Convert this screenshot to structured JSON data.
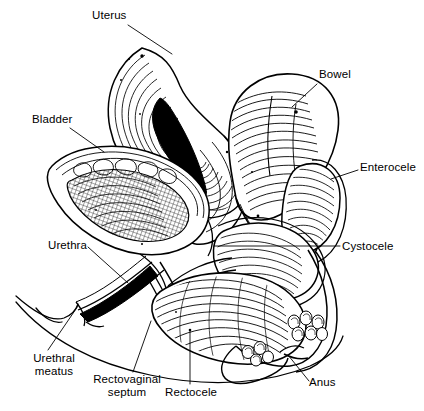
{
  "figure": {
    "type": "medical-illustration",
    "view": "sagittal-section",
    "style": "black-and-white-line-art",
    "background_color": "#ffffff",
    "ink_color": "#000000",
    "width": 424,
    "height": 411
  },
  "labels": [
    {
      "id": "uterus",
      "text": "Uterus",
      "x": 92,
      "y": 9,
      "lines": [
        "Uterus"
      ]
    },
    {
      "id": "bowel",
      "text": "Bowel",
      "x": 319,
      "y": 68,
      "lines": [
        "Bowel"
      ]
    },
    {
      "id": "bladder",
      "text": "Bladder",
      "x": 32,
      "y": 113,
      "lines": [
        "Bladder"
      ]
    },
    {
      "id": "enterocele",
      "text": "Enterocele",
      "x": 360,
      "y": 161,
      "lines": [
        "Enterocele"
      ]
    },
    {
      "id": "urethra",
      "text": "Urethra",
      "x": 48,
      "y": 239,
      "lines": [
        "Urethra"
      ]
    },
    {
      "id": "cystocele",
      "text": "Cystocele",
      "x": 342,
      "y": 240,
      "lines": [
        "Cystocele"
      ]
    },
    {
      "id": "urethral-meatus",
      "text": "Urethral meatus",
      "x": 17,
      "y": 352,
      "lines": [
        "Urethral",
        "meatus"
      ]
    },
    {
      "id": "rectovaginal-septum",
      "text": "Rectovaginal septum",
      "x": 88,
      "y": 373,
      "lines": [
        "Rectovaginal",
        "septum"
      ]
    },
    {
      "id": "rectocele",
      "text": "Rectocele",
      "x": 165,
      "y": 386,
      "lines": [
        "Rectocele"
      ]
    },
    {
      "id": "anus",
      "text": "Anus",
      "x": 309,
      "y": 376,
      "lines": [
        "Anus"
      ]
    }
  ],
  "leader_lines": [
    {
      "id": "leader-uterus",
      "from_label": "Uterus",
      "path": "M128,25 L172,54"
    },
    {
      "id": "leader-bowel",
      "from_label": "Bowel",
      "path": "M317,84 L292,107"
    },
    {
      "id": "leader-bladder",
      "from_label": "Bladder",
      "path": "M70,128 L104,152"
    },
    {
      "id": "leader-enterocele",
      "from_label": "Enterocele",
      "path": "M358,170 L331,179"
    },
    {
      "id": "leader-urethra",
      "from_label": "Urethra",
      "path": "M88,247 L128,283"
    },
    {
      "id": "leader-cystocele",
      "from_label": "Cystocele",
      "path": "M340,246 L214,246"
    },
    {
      "id": "leader-urethral-meatus",
      "from_label": "Urethral meatus",
      "path": "M48,350 L78,306"
    },
    {
      "id": "leader-rectovaginal-septum",
      "from_label": "Rectovaginal septum",
      "path": "M133,372 L151,321"
    },
    {
      "id": "leader-rectocele",
      "from_label": "Rectocele",
      "path": "M190,384 L190,330"
    },
    {
      "id": "leader-anus",
      "from_label": "Anus",
      "path": "M309,381 L288,355"
    }
  ],
  "anatomy_regions": [
    {
      "id": "uterus-body",
      "name": "Uterus",
      "rendering": "concentric-contour-layers-with-dark-cavity"
    },
    {
      "id": "uterine-cavity",
      "name": "Uterine cavity",
      "rendering": "solid-black-teardrop"
    },
    {
      "id": "bowel-loop",
      "name": "Bowel",
      "rendering": "transverse-hatched-tube"
    },
    {
      "id": "bladder-sac",
      "name": "Bladder",
      "rendering": "cross-hatched-sac-with-rugae"
    },
    {
      "id": "enterocele-sac",
      "name": "Enterocele",
      "rendering": "hatched-herniated-pouch"
    },
    {
      "id": "cystocele-bulge",
      "name": "Cystocele",
      "rendering": "hatched-anterior-bulge"
    },
    {
      "id": "rectocele-bulge",
      "name": "Rectocele",
      "rendering": "dense-curved-cross-hatching"
    },
    {
      "id": "rectovaginal-septum",
      "name": "Rectovaginal septum",
      "rendering": "thin-fibrous-band"
    },
    {
      "id": "urethra-canal",
      "name": "Urethra",
      "rendering": "narrow-dark-canal"
    },
    {
      "id": "urethral-meatus",
      "name": "Urethral meatus",
      "rendering": "perineal-contour-opening"
    },
    {
      "id": "anal-sphincter",
      "name": "Anus",
      "rendering": "clustered-muscle-bundles"
    },
    {
      "id": "perineal-outline",
      "name": "Perineal body outline",
      "rendering": "single-contour-stroke"
    }
  ]
}
